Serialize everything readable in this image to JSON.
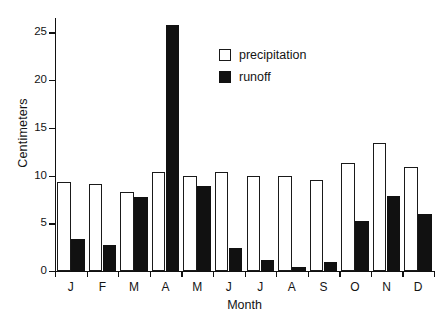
{
  "chart_data": {
    "type": "bar",
    "title": "",
    "subtitle": "",
    "xlabel": "Month",
    "ylabel": "Centimeters",
    "categories": [
      "J",
      "F",
      "M",
      "A",
      "M",
      "J",
      "J",
      "A",
      "S",
      "O",
      "N",
      "D"
    ],
    "series": [
      {
        "name": "precipitation",
        "color": "#ffffff",
        "edge_color": "#1a1a1a",
        "values": [
          9.3,
          9.1,
          8.3,
          10.4,
          10.0,
          10.4,
          10.0,
          9.9,
          9.5,
          11.3,
          13.4,
          10.9
        ]
      },
      {
        "name": "runoff",
        "color": "#111111",
        "edge_color": "#111111",
        "values": [
          3.4,
          2.7,
          7.8,
          25.8,
          8.9,
          2.4,
          1.2,
          0.4,
          0.9,
          5.2,
          7.9,
          6.0
        ]
      }
    ],
    "ylim": [
      0,
      26.5
    ],
    "yticks": [
      0,
      5,
      10,
      15,
      20,
      25
    ],
    "ytick_labels": [
      "0",
      "5",
      "10",
      "15",
      "20",
      "25"
    ],
    "grid": false,
    "legend_position": "upper center",
    "legend_entries": [
      {
        "label": "precipitation",
        "swatch": "hollow-square"
      },
      {
        "label": "runoff",
        "swatch": "filled-square"
      }
    ]
  }
}
